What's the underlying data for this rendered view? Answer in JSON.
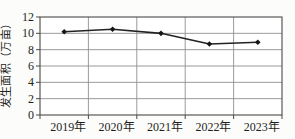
{
  "chart_data": {
    "type": "line",
    "categories": [
      "2019年",
      "2020年",
      "2021年",
      "2022年",
      "2023年"
    ],
    "values": [
      10.2,
      10.5,
      10.0,
      8.7,
      8.9
    ],
    "title": "",
    "xlabel": "",
    "ylabel": "发生面积（万亩）",
    "ylim": [
      0,
      12
    ],
    "yticks": [
      0,
      2,
      4,
      6,
      8,
      10,
      12
    ],
    "grid": true,
    "legend": false,
    "marker": "diamond",
    "colors": {
      "line": "#232323",
      "marker": "#161616",
      "grid": "#8f8f8f",
      "border": "#4a4a4a",
      "text": "#1f1f1f",
      "plot_background": "#ffffff"
    }
  }
}
